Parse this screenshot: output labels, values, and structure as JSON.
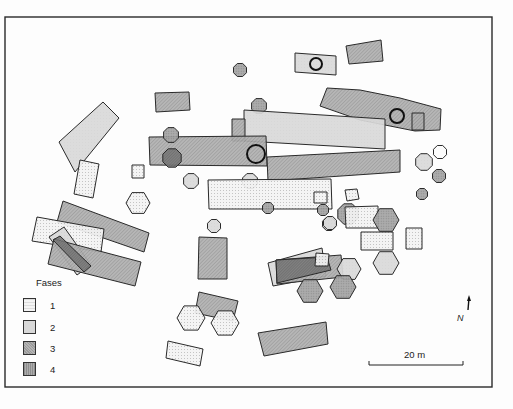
{
  "map": {
    "frame": {
      "x": 5,
      "y": 17,
      "w": 487,
      "h": 370
    },
    "colors": {
      "background": "#fdfdfd",
      "stroke": "#2a2a2a",
      "fase1_fill": "#f1f1f1",
      "fase2_fill": "#d6d6d6",
      "fase3_fill": "#a9a9a9",
      "fase4_fill": "#9c9c9c",
      "dark_overlap": "#6e6e6e"
    },
    "legend": {
      "title": "Fases",
      "items": [
        {
          "label": "1",
          "fase": 1
        },
        {
          "label": "2",
          "fase": 2
        },
        {
          "label": "3",
          "fase": 3
        },
        {
          "label": "4",
          "fase": 4
        }
      ]
    },
    "scale_bar": {
      "label": "20 m",
      "x1": 369,
      "x2": 463,
      "y": 365
    },
    "north_arrow": {
      "label": "N",
      "x": 469,
      "y1": 298,
      "y2": 310
    },
    "features": [
      {
        "type": "poly",
        "fase": 3,
        "pts": "346,46 381,40 383,61 349,64"
      },
      {
        "type": "poly",
        "fase": 2,
        "pts": "295,53 336,56 336,75 295,72"
      },
      {
        "type": "ring",
        "cx": 316,
        "cy": 64,
        "r": 6
      },
      {
        "type": "blob",
        "fase": 4,
        "cx": 240,
        "cy": 70,
        "r": 7
      },
      {
        "type": "poly",
        "fase": 3,
        "pts": "155,93 189,92 190,110 156,112"
      },
      {
        "type": "poly",
        "fase": 3,
        "pts": "327,88 360,90 400,98 441,109 440,130 415,131 360,120 320,106"
      },
      {
        "type": "blob",
        "fase": 4,
        "cx": 259,
        "cy": 106,
        "r": 8
      },
      {
        "type": "poly",
        "fase": 2,
        "pts": "244,110 385,119 385,149 244,141"
      },
      {
        "type": "ring",
        "cx": 397,
        "cy": 116,
        "r": 7
      },
      {
        "type": "poly",
        "fase": 3,
        "pts": "412,113 424,113 424,130 412,130"
      },
      {
        "type": "poly",
        "fase": 3,
        "pts": "232,119 245,119 245,141 232,141"
      },
      {
        "type": "poly",
        "fase": 2,
        "pts": "59,142 103,102 119,118 75,172"
      },
      {
        "type": "poly",
        "fase": 3,
        "pts": "149,137 266,136 267,166 150,165"
      },
      {
        "type": "blob",
        "fase": 4,
        "cx": 171,
        "cy": 135,
        "r": 8
      },
      {
        "type": "blob",
        "fase": 4,
        "cx": 172,
        "cy": 158,
        "r": 10,
        "dark": true
      },
      {
        "type": "ring",
        "cx": 256,
        "cy": 154,
        "r": 9
      },
      {
        "type": "poly",
        "fase": 3,
        "pts": "267,157 400,150 400,172 268,181"
      },
      {
        "type": "blob",
        "fase": 2,
        "cx": 424,
        "cy": 162,
        "r": 9
      },
      {
        "type": "blob",
        "fase": 0,
        "cx": 440,
        "cy": 152,
        "r": 7
      },
      {
        "type": "blob",
        "fase": 4,
        "cx": 439,
        "cy": 176,
        "r": 7
      },
      {
        "type": "blob",
        "fase": 4,
        "cx": 422,
        "cy": 194,
        "r": 6
      },
      {
        "type": "poly",
        "fase": 1,
        "pts": "80,160 99,164 93,198 74,194"
      },
      {
        "type": "poly",
        "fase": 1,
        "pts": "132,165 144,165 144,178 132,178"
      },
      {
        "type": "blob",
        "fase": 2,
        "cx": 191,
        "cy": 181,
        "r": 8
      },
      {
        "type": "blob",
        "fase": 2,
        "cx": 250,
        "cy": 181,
        "r": 8
      },
      {
        "type": "poly",
        "fase": 1,
        "pts": "208,180 331,179 332,209 209,209"
      },
      {
        "type": "poly",
        "fase": 1,
        "pts": "314,192 327,192 327,203 314,203"
      },
      {
        "type": "poly",
        "fase": 1,
        "pts": "345,190 357,189 359,199 347,201"
      },
      {
        "type": "hex",
        "fase": 1,
        "cx": 138,
        "cy": 203,
        "r": 12
      },
      {
        "type": "blob",
        "fase": 4,
        "cx": 268,
        "cy": 208,
        "r": 6
      },
      {
        "type": "blob",
        "fase": 4,
        "cx": 323,
        "cy": 210,
        "r": 6
      },
      {
        "type": "poly",
        "fase": 3,
        "pts": "63,201 149,233 144,252 57,222"
      },
      {
        "type": "poly",
        "fase": 1,
        "pts": "37,217 104,229 101,252 32,241"
      },
      {
        "type": "poly",
        "fase": 2,
        "pts": "49,237 64,227 91,265 77,275"
      },
      {
        "type": "poly",
        "fase": 3,
        "pts": "54,239 141,262 135,286 48,264"
      },
      {
        "type": "poly",
        "fase": 3,
        "pts": "53,240 60,236 91,266 84,272",
        "dark": true
      },
      {
        "type": "blob",
        "fase": 4,
        "cx": 348,
        "cy": 214,
        "r": 11
      },
      {
        "type": "poly",
        "fase": 1,
        "pts": "345,207 378,206 378,228 346,228"
      },
      {
        "type": "hex",
        "fase": 4,
        "cx": 386,
        "cy": 220,
        "r": 13
      },
      {
        "type": "blob",
        "fase": 2,
        "cx": 329,
        "cy": 224,
        "r": 7
      },
      {
        "type": "blob",
        "fase": 2,
        "cx": 330,
        "cy": 223,
        "r": 7
      },
      {
        "type": "blob",
        "fase": 2,
        "cx": 214,
        "cy": 226,
        "r": 7
      },
      {
        "type": "poly",
        "fase": 1,
        "pts": "361,232 393,232 393,250 361,250"
      },
      {
        "type": "poly",
        "fase": 1,
        "pts": "406,228 422,228 422,249 406,249"
      },
      {
        "type": "poly",
        "fase": 3,
        "pts": "199,237 227,238 227,279 198,279"
      },
      {
        "type": "hex",
        "fase": 2,
        "cx": 386,
        "cy": 263,
        "r": 13
      },
      {
        "type": "poly",
        "fase": 2,
        "pts": "268,263 322,248 326,276 273,286"
      },
      {
        "type": "poly",
        "fase": 3,
        "pts": "276,260 341,255 343,277 277,284"
      },
      {
        "type": "poly",
        "fase": 4,
        "pts": "276,260 327,257 331,270 277,283",
        "dark": true
      },
      {
        "type": "poly",
        "fase": 1,
        "pts": "316,253 329,254 328,266 315,266"
      },
      {
        "type": "hex",
        "fase": 2,
        "cx": 349,
        "cy": 269,
        "r": 12
      },
      {
        "type": "hex",
        "fase": 4,
        "cx": 310,
        "cy": 291,
        "r": 13
      },
      {
        "type": "hex",
        "fase": 4,
        "cx": 343,
        "cy": 287,
        "r": 13
      },
      {
        "type": "poly",
        "fase": 3,
        "pts": "199,292 238,301 233,321 195,313"
      },
      {
        "type": "hex",
        "fase": 1,
        "cx": 191,
        "cy": 318,
        "r": 14
      },
      {
        "type": "hex",
        "fase": 1,
        "cx": 225,
        "cy": 323,
        "r": 14
      },
      {
        "type": "poly",
        "fase": 1,
        "pts": "168,341 203,349 200,366 166,358"
      },
      {
        "type": "poly",
        "fase": 3,
        "pts": "258,333 326,322 328,344 264,356"
      }
    ]
  }
}
